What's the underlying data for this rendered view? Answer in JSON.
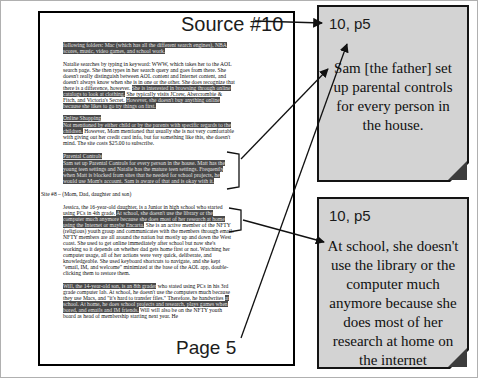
{
  "labels": {
    "source": "Source #10",
    "page": "Page 5"
  },
  "document": {
    "blocks": [
      {
        "type": "p",
        "segments": [
          {
            "hl": true,
            "text": "following folders: Mac (which has all the different search engines), NBA scores, music, video games, and school work."
          }
        ]
      },
      {
        "type": "p",
        "segments": [
          {
            "hl": false,
            "text": "Natalie searches by typing in keyword: WWW, which takes her to the AOL search page.  She then types in her search query and goes from there.  She doesn't really distinguish between AOL content and Internet content, and doesn't always know when she is in one or the other.  She does recognize that there is a difference, however.  "
          },
          {
            "hl": true,
            "text": "She is interested in browsing through online catalogs to look at clothing."
          },
          {
            "hl": false,
            "text": "  She typically visits JCrew, Abercrombie & Fitch, and Victoria's Secret.  "
          },
          {
            "hl": true,
            "text": "However, she doesn't buy anything online because she likes to go try things on first."
          }
        ]
      },
      {
        "type": "h",
        "text": "Online Shopping"
      },
      {
        "type": "p",
        "segments": [
          {
            "hl": true,
            "text": "Not mentioned by either child or by the parents with specific regards to the children."
          },
          {
            "hl": false,
            "text": "  However, Mom mentioned that usually she is not very comfortable with giving out her credit card info, but for something like this, she doesn't mind.  The site costs $25.00 to subscribe."
          }
        ]
      },
      {
        "type": "h",
        "text": "Parental Controls"
      },
      {
        "type": "p",
        "segments": [
          {
            "hl": true,
            "text": "Sam set up Parental Controls for every person in the house.  Matt has the young teen settings and Natalie has the mature teen settings.  Frequently when Matt is blocked from sites that he needed for school projects, he would use Mom's account.  Sam is aware of that and is okay with it."
          }
        ]
      },
      {
        "type": "site",
        "text": "Site #8 – (Mom, Dad, daughter and son)"
      },
      {
        "type": "p",
        "segments": [
          {
            "hl": false,
            "text": "Jessica, the 16-year-old daughter, is a Junior in high school who started using PCs in 4th grade.  "
          },
          {
            "hl": true,
            "text": "At school, she doesn't use the library or the computer much anymore because she does most of her research at home using the Internet or maybe Encarta."
          },
          {
            "hl": false,
            "text": "  She is an active member of the NFTY (religious) youth group and communicates with the members through email.  NFTY members are all around the nation but mostly up and down the West coast.  She used to get online immediately after school but now she's working so it depends on whether dad gets home first or not.  Watching her computer usage, all of her actions were very quick, deliberate, and knowledgeable.  She used keyboard shortcuts to navigate, and she kept \"email, IM, and welcome\" minimized at the base of the AOL app, double-clicking them to restore them."
          }
        ]
      },
      {
        "type": "p",
        "segments": [
          {
            "hl": true,
            "text": "Will, the 14-year-old son, is an 8th grader"
          },
          {
            "hl": false,
            "text": " who stated using PCs in his 3rd grade computer lab.  At school, he doesn't use the computers much because they use Macs, and \"it's hard to transfer files.\"  Therefore, he handwrites "
          },
          {
            "hl": true,
            "text": "at school.  At home, he does school projects and research, plays games when bored, and emails and IM friends."
          },
          {
            "hl": false,
            "text": "  Will will also be on the NFTY youth board as head of membership starting next year.  He"
          }
        ]
      }
    ]
  },
  "notes": [
    {
      "ref": "10, p5",
      "quote": "Sam [the father] set up parental controls for every person in the house."
    },
    {
      "ref": "10, p5",
      "quote": "At school, she doesn't use the library or the computer much anymore because she does most of her research at home on the internet"
    }
  ],
  "connectors": [
    {
      "from": "source-label",
      "to": "note-1-ref"
    },
    {
      "from": "parental-controls-paragraph",
      "to": "note-1-quote"
    },
    {
      "from": "page-label",
      "to": "note-1-ref"
    },
    {
      "from": "jessica-highlight",
      "to": "note-2-quote"
    }
  ],
  "colors": {
    "note_fill": "#d3d3d3",
    "note_fold": "#3d3d3d",
    "highlight_bg": "#4a4a4a",
    "highlight_text": "#e3e3e3",
    "border": "#000000",
    "arrow": "#111111"
  }
}
